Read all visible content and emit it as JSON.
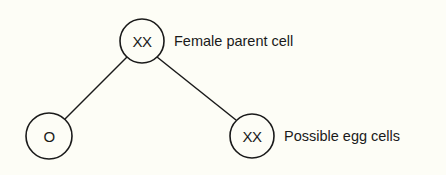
{
  "diagram": {
    "type": "tree",
    "nodes": [
      {
        "id": "parent",
        "label": "XX",
        "caption": "Female parent cell",
        "cx": 142,
        "cy": 41,
        "r": 22
      },
      {
        "id": "egg-left",
        "label": "O",
        "caption": "",
        "cx": 49,
        "cy": 136,
        "r": 23
      },
      {
        "id": "egg-right",
        "label": "XX",
        "caption": "Possible egg cells",
        "cx": 252,
        "cy": 136,
        "r": 22
      }
    ],
    "edges": [
      {
        "from": "parent",
        "to": "egg-left"
      },
      {
        "from": "parent",
        "to": "egg-right"
      }
    ]
  },
  "colors": {
    "background": "#fdfdf6",
    "stroke": "#1a1a1a"
  }
}
